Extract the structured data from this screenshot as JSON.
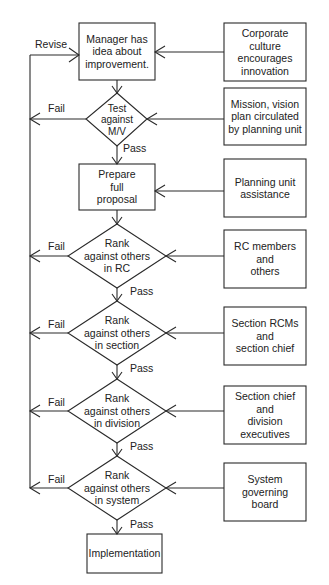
{
  "diagram": {
    "type": "flowchart",
    "main_flow": [
      {
        "id": "idea",
        "shape": "box",
        "text": "Manager has\nidea about\nimprovement."
      },
      {
        "id": "test_mv",
        "shape": "diamond",
        "text": "Test\nagainst\nM/V"
      },
      {
        "id": "prepare",
        "shape": "box",
        "text": "Prepare\nfull\nproposal"
      },
      {
        "id": "rank_rc",
        "shape": "diamond",
        "text": "Rank\nagainst others\nin RC"
      },
      {
        "id": "rank_section",
        "shape": "diamond",
        "text": "Rank\nagainst others\nin section"
      },
      {
        "id": "rank_division",
        "shape": "diamond",
        "text": "Rank\nagainst others\nin division"
      },
      {
        "id": "rank_system",
        "shape": "diamond",
        "text": "Rank\nagainst others\nin system"
      },
      {
        "id": "implementation",
        "shape": "box",
        "text": "Implementation"
      }
    ],
    "inputs": [
      {
        "id": "culture",
        "target": "idea",
        "text": "Corporate\nculture\nencourages\ninnovation"
      },
      {
        "id": "mission",
        "target": "test_mv",
        "text": "Mission, vision\nplan circulated\nby planning unit"
      },
      {
        "id": "planning",
        "target": "prepare",
        "text": "Planning unit\nassistance"
      },
      {
        "id": "rc_members",
        "target": "rank_rc",
        "text": "RC members\nand\nothers"
      },
      {
        "id": "section_rcms",
        "target": "rank_section",
        "text": "Section RCMs\nand\nsection chief"
      },
      {
        "id": "section_chief",
        "target": "rank_division",
        "text": "Section chief\nand\ndivision\nexecutives"
      },
      {
        "id": "governing",
        "target": "rank_system",
        "text": "System\ngoverning\nboard"
      }
    ],
    "edge_labels": {
      "revise": "Revise",
      "fail": "Fail",
      "pass": "Pass"
    }
  }
}
